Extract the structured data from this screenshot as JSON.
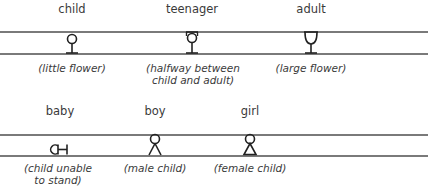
{
  "rows": [
    {
      "items": [
        {
          "label": "child",
          "note": "(little flower)",
          "glyph": "little-flower"
        },
        {
          "label": "teenager",
          "note": "(halfway between\nchild and adult)",
          "note_lines": [
            "(halfway between",
            "child and adult)"
          ],
          "glyph": "medium-flower"
        },
        {
          "label": "adult",
          "note": "(large flower)",
          "glyph": "large-flower"
        }
      ]
    },
    {
      "items": [
        {
          "label": "baby",
          "note_lines": [
            "(child unable",
            "to stand)"
          ],
          "glyph": "lying-child"
        },
        {
          "label": "boy",
          "note": "(male child)",
          "glyph": "male-child"
        },
        {
          "label": "girl",
          "note": "(female child)",
          "glyph": "female-child"
        }
      ]
    }
  ],
  "colors": {
    "line": "#7a7a7a",
    "glyph": "#222222",
    "text": "#3a3a3a"
  }
}
